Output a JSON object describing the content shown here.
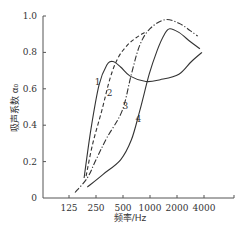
{
  "chart_data": {
    "type": "line",
    "title": "",
    "xlabel": "频率/Hz",
    "ylabel": "吸声系数 α₀",
    "x_scale": "log2",
    "x_ticks": [
      125,
      250,
      500,
      1000,
      2000,
      4000
    ],
    "y_ticks": [
      0,
      0.2,
      0.4,
      0.6,
      0.8,
      1.0
    ],
    "y_tick_labels": [
      "0",
      "0.2",
      "0.4",
      "0.6",
      "0.8",
      "1.0"
    ],
    "ylim": [
      0,
      1.0
    ],
    "grid": false,
    "legend": "inline curve labels",
    "series": [
      {
        "name": "1",
        "style": "solid",
        "label_pos": {
          "f": 260,
          "a": 0.62
        },
        "points": [
          [
            184,
            0.11
          ],
          [
            220,
            0.38
          ],
          [
            270,
            0.62
          ],
          [
            330,
            0.73
          ],
          [
            385,
            0.75
          ],
          [
            470,
            0.72
          ],
          [
            600,
            0.67
          ],
          [
            900,
            0.64
          ],
          [
            1300,
            0.65
          ],
          [
            2100,
            0.68
          ],
          [
            2900,
            0.75
          ],
          [
            3800,
            0.8
          ]
        ]
      },
      {
        "name": "2",
        "style": "dashed",
        "label_pos": {
          "f": 355,
          "a": 0.56
        },
        "points": [
          [
            194,
            0.12
          ],
          [
            230,
            0.3
          ],
          [
            290,
            0.48
          ],
          [
            360,
            0.66
          ],
          [
            440,
            0.77
          ],
          [
            560,
            0.84
          ],
          [
            700,
            0.88
          ],
          [
            870,
            0.91
          ]
        ]
      },
      {
        "name": "3",
        "style": "dashdot",
        "label_pos": {
          "f": 530,
          "a": 0.49
        },
        "points": [
          [
            146,
            0.03
          ],
          [
            200,
            0.11
          ],
          [
            250,
            0.21
          ],
          [
            330,
            0.33
          ],
          [
            490,
            0.48
          ],
          [
            620,
            0.68
          ],
          [
            770,
            0.84
          ],
          [
            1000,
            0.93
          ],
          [
            1470,
            0.98
          ],
          [
            2100,
            0.96
          ],
          [
            2800,
            0.92
          ],
          [
            3400,
            0.89
          ]
        ]
      },
      {
        "name": "4",
        "style": "solid",
        "label_pos": {
          "f": 740,
          "a": 0.42
        },
        "points": [
          [
            200,
            0.06
          ],
          [
            300,
            0.13
          ],
          [
            470,
            0.21
          ],
          [
            620,
            0.32
          ],
          [
            770,
            0.48
          ],
          [
            980,
            0.68
          ],
          [
            1200,
            0.81
          ],
          [
            1450,
            0.9
          ],
          [
            1660,
            0.93
          ],
          [
            2100,
            0.91
          ],
          [
            2800,
            0.86
          ],
          [
            3600,
            0.82
          ]
        ]
      }
    ]
  },
  "colors": {
    "axis": "#555555",
    "curve": "#333333"
  }
}
